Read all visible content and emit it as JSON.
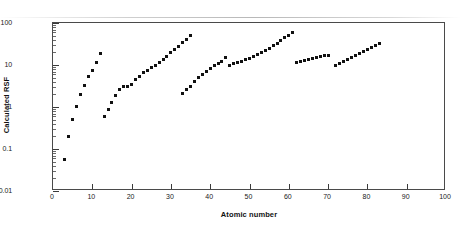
{
  "chart_data": {
    "type": "scatter",
    "title": "",
    "xlabel": "Atomic number",
    "ylabel": "Calculated RSF",
    "xlim": [
      0,
      100
    ],
    "ylim": [
      0.01,
      100
    ],
    "yscale": "log",
    "xscale": "linear",
    "grid": false,
    "legend": "none",
    "marker": "square",
    "marker_color": "#111111",
    "xticks": [
      0,
      10,
      20,
      30,
      40,
      50,
      60,
      70,
      80,
      90,
      100
    ],
    "xtick_labels": [
      "0",
      "10",
      "20",
      "30",
      "40",
      "50",
      "60",
      "70",
      "80",
      "90",
      "100"
    ],
    "yticks": [
      0.01,
      0.1,
      1,
      10,
      100
    ],
    "ytick_labels": [
      "0.01",
      "0.1",
      "1",
      "10",
      "100"
    ],
    "series": [
      {
        "name": "Period 2",
        "points": [
          [
            3,
            0.055
          ],
          [
            4,
            0.2
          ],
          [
            5,
            0.5
          ],
          [
            6,
            1.05
          ],
          [
            7,
            2.0
          ],
          [
            8,
            3.3
          ],
          [
            9,
            5.2
          ],
          [
            10,
            7.6
          ],
          [
            11,
            11.5
          ],
          [
            12,
            19.0
          ]
        ]
      },
      {
        "name": "Period 3-4",
        "points": [
          [
            13,
            0.58
          ],
          [
            14,
            0.85
          ],
          [
            15,
            1.3
          ],
          [
            16,
            1.9
          ],
          [
            17,
            2.6
          ],
          [
            18,
            3.0
          ],
          [
            19,
            3.1
          ],
          [
            20,
            3.5
          ],
          [
            21,
            4.4
          ],
          [
            22,
            5.4
          ],
          [
            23,
            6.6
          ],
          [
            24,
            7.6
          ],
          [
            25,
            8.6
          ],
          [
            26,
            10.0
          ],
          [
            27,
            11.5
          ],
          [
            28,
            13.5
          ],
          [
            29,
            16.0
          ],
          [
            30,
            19.5
          ],
          [
            31,
            23.0
          ],
          [
            32,
            28.0
          ],
          [
            33,
            34.0
          ],
          [
            34,
            41.0
          ],
          [
            35,
            50.0
          ]
        ]
      },
      {
        "name": "Period 5a",
        "points": [
          [
            33,
            2.05
          ],
          [
            34,
            2.6
          ],
          [
            35,
            3.1
          ],
          [
            36,
            4.0
          ],
          [
            37,
            5.0
          ],
          [
            38,
            6.0
          ],
          [
            39,
            7.0
          ],
          [
            40,
            8.2
          ],
          [
            41,
            9.6
          ],
          [
            42,
            11.0
          ],
          [
            43,
            12.4
          ],
          [
            44,
            15.0
          ]
        ]
      },
      {
        "name": "Period 5b-6",
        "points": [
          [
            45,
            10.0
          ],
          [
            46,
            10.6
          ],
          [
            47,
            11.4
          ],
          [
            48,
            12.3
          ],
          [
            49,
            13.3
          ],
          [
            50,
            14.5
          ],
          [
            51,
            16.0
          ],
          [
            52,
            17.6
          ],
          [
            53,
            19.5
          ],
          [
            54,
            22.0
          ],
          [
            55,
            25.0
          ],
          [
            56,
            29.0
          ],
          [
            57,
            33.0
          ],
          [
            58,
            38.0
          ],
          [
            59,
            44.0
          ],
          [
            60,
            51.0
          ],
          [
            61,
            60.0
          ]
        ]
      },
      {
        "name": "Lanthanides",
        "points": [
          [
            62,
            11.2
          ],
          [
            63,
            11.8
          ],
          [
            64,
            12.5
          ],
          [
            65,
            13.2
          ],
          [
            66,
            14.0
          ],
          [
            67,
            14.8
          ],
          [
            68,
            15.6
          ],
          [
            69,
            16.4
          ],
          [
            70,
            17.0
          ]
        ]
      },
      {
        "name": "Period 6b",
        "points": [
          [
            72,
            9.6
          ],
          [
            73,
            10.8
          ],
          [
            74,
            12.0
          ],
          [
            75,
            13.3
          ],
          [
            76,
            14.8
          ],
          [
            77,
            16.4
          ],
          [
            78,
            18.3
          ],
          [
            79,
            20.5
          ],
          [
            80,
            23.0
          ],
          [
            81,
            26.0
          ],
          [
            82,
            29.5
          ],
          [
            83,
            33.0
          ]
        ]
      }
    ]
  }
}
